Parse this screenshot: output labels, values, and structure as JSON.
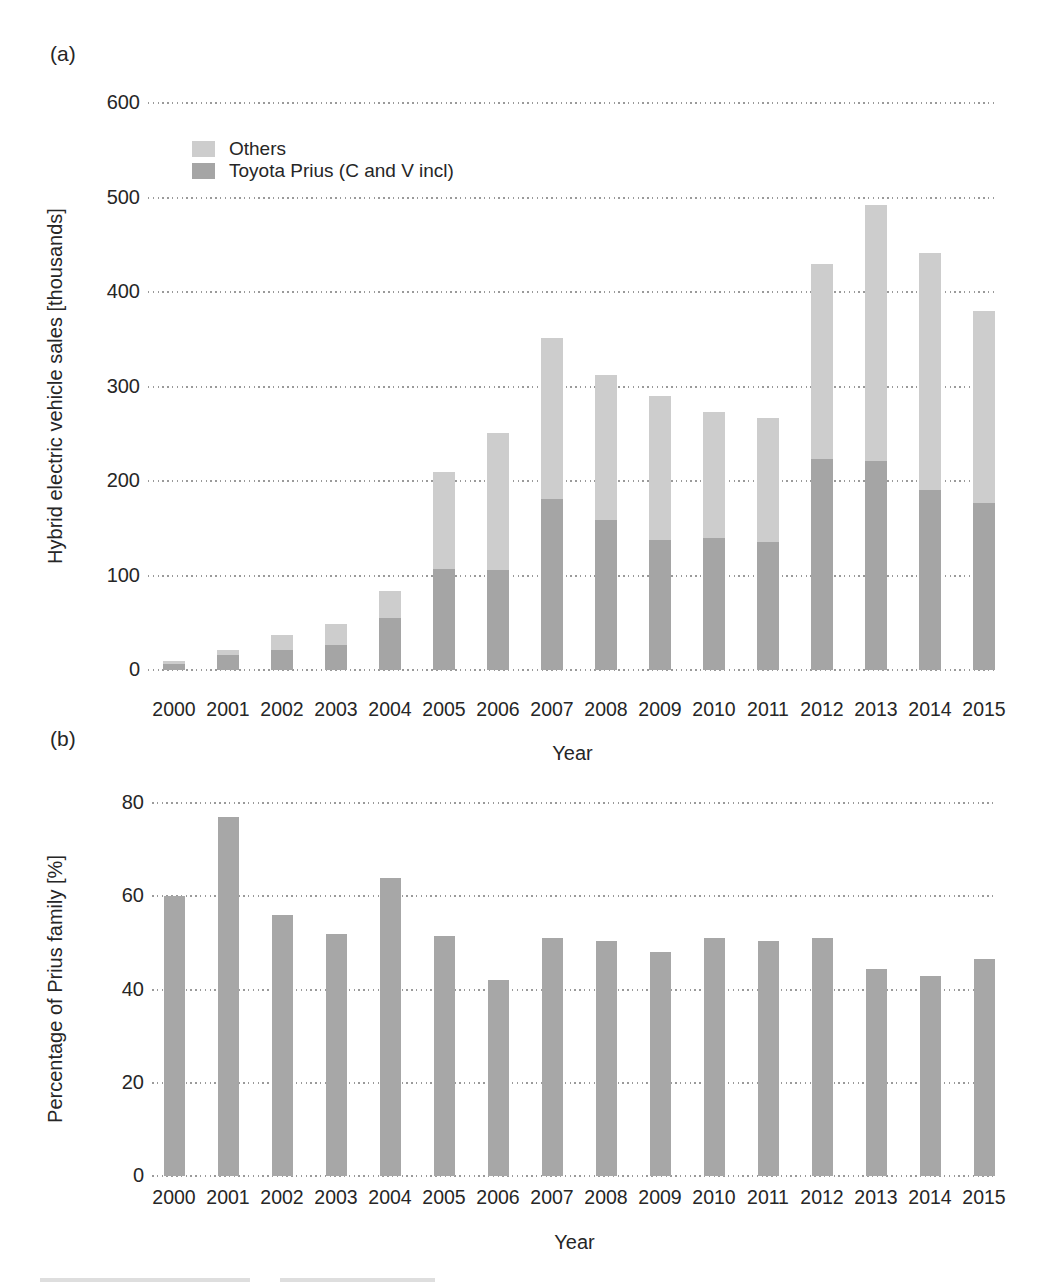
{
  "figure": {
    "panel_a_tag": "(a)",
    "panel_b_tag": "(b)"
  },
  "colors": {
    "others_bar": "#cdcdcd",
    "prius_bar": "#a5a5a5",
    "percent_bar": "#a7a7a7",
    "gridline": "#9a9a9a",
    "text": "#262626"
  },
  "chart_data": [
    {
      "type": "bar",
      "stacked": true,
      "panel": "(a)",
      "title": "Hybrid electric vehicle sales by year, Prius family vs others",
      "categories": [
        "2000",
        "2001",
        "2002",
        "2003",
        "2004",
        "2005",
        "2006",
        "2007",
        "2008",
        "2009",
        "2010",
        "2011",
        "2012",
        "2013",
        "2014",
        "2015"
      ],
      "series": [
        {
          "name": "Toyota Prius (C and V incl)",
          "values": [
            6,
            16,
            21,
            26,
            55,
            107,
            106,
            181,
            159,
            138,
            140,
            135,
            223,
            221,
            190,
            177
          ]
        },
        {
          "name": "Others",
          "values": [
            4,
            5,
            16,
            23,
            29,
            102,
            145,
            170,
            153,
            152,
            133,
            132,
            207,
            271,
            251,
            203
          ]
        }
      ],
      "totals": [
        10,
        21,
        37,
        49,
        84,
        209,
        251,
        351,
        312,
        290,
        273,
        267,
        430,
        492,
        441,
        380
      ],
      "xlabel": "Year",
      "ylabel": "Hybrid electric vehicle sales [thousands]",
      "ylim": [
        0,
        600
      ],
      "yticks": [
        0,
        100,
        200,
        300,
        400,
        500,
        600
      ],
      "grid": "horizontal dotted",
      "legend": [
        "Others",
        "Toyota Prius (C and V incl)"
      ],
      "legend_position": "upper left inside plot"
    },
    {
      "type": "bar",
      "stacked": false,
      "panel": "(b)",
      "title": "Percentage of Prius family among hybrid electric vehicle sales",
      "categories": [
        "2000",
        "2001",
        "2002",
        "2003",
        "2004",
        "2005",
        "2006",
        "2007",
        "2008",
        "2009",
        "2010",
        "2011",
        "2012",
        "2013",
        "2014",
        "2015"
      ],
      "values": [
        60,
        77,
        56,
        52,
        64,
        51.5,
        42,
        51,
        50.5,
        48,
        51,
        50.5,
        51,
        44.5,
        43,
        46.5
      ],
      "xlabel": "Year",
      "ylabel": "Percentage of Prius family [%]",
      "ylim": [
        0,
        80
      ],
      "yticks": [
        0,
        20,
        40,
        60,
        80
      ],
      "grid": "horizontal dotted",
      "legend": []
    }
  ],
  "bottom_edge": {
    "cutoff_text_fragment": "illegible text cut off at bottom edge of page"
  }
}
